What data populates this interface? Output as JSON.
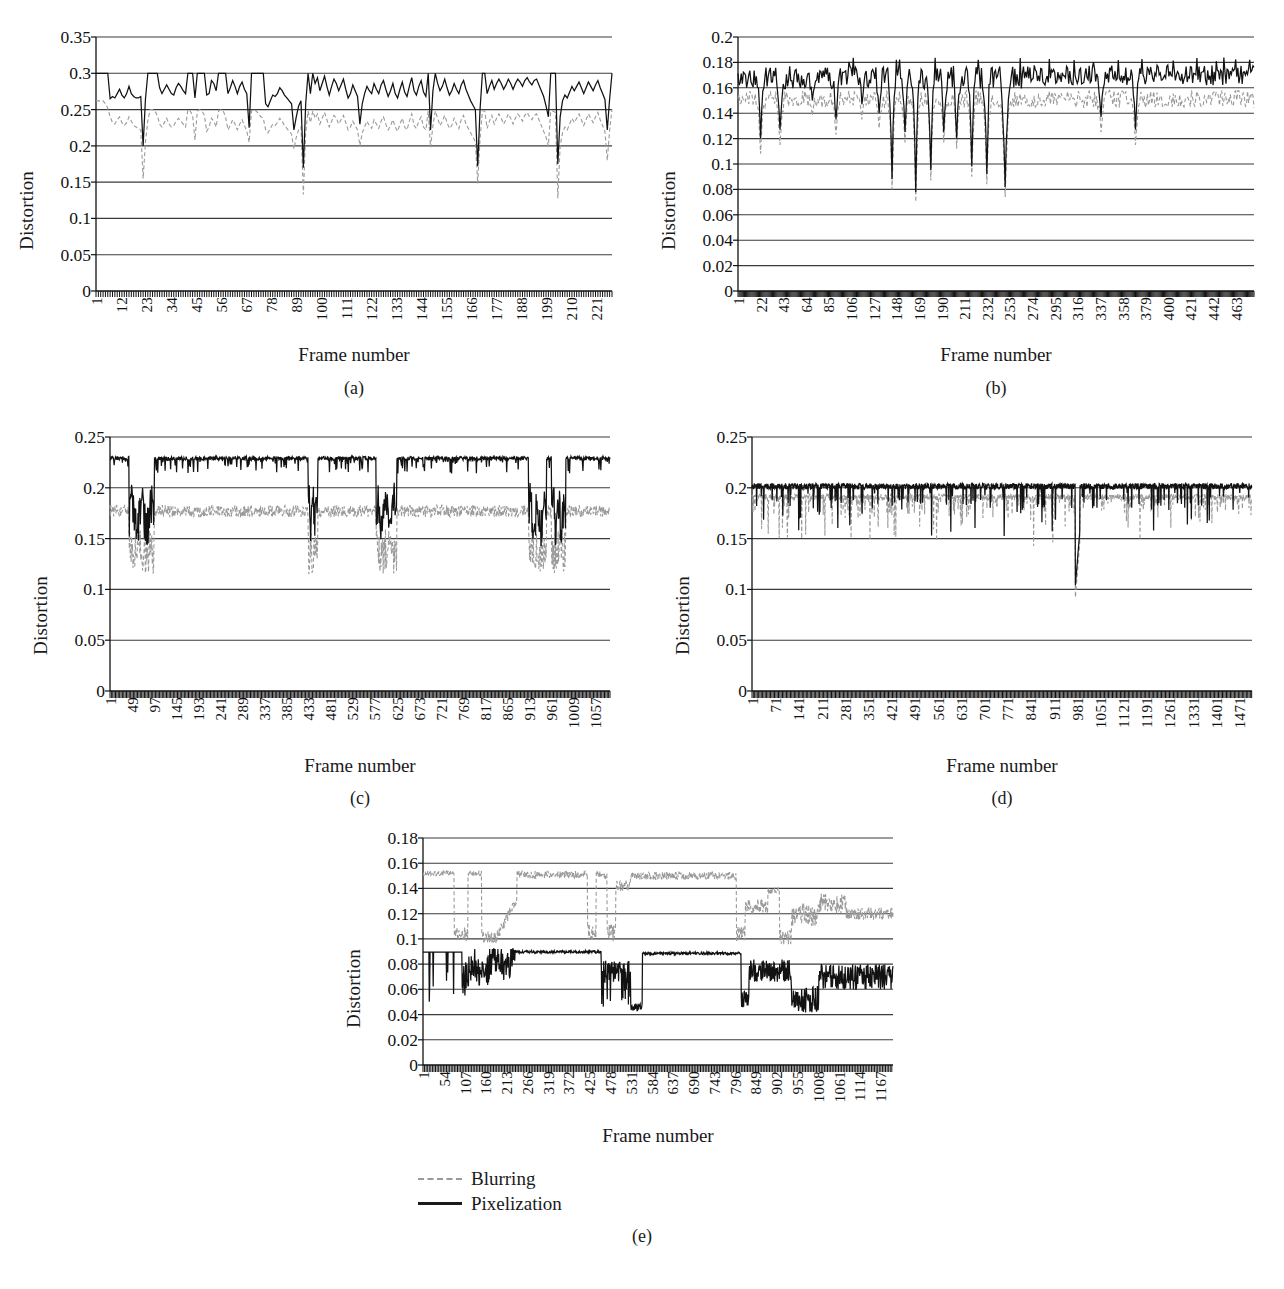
{
  "figure": {
    "legend": {
      "items": [
        {
          "label": "Blurring",
          "style": "dashed",
          "color": "#9a9a9a"
        },
        {
          "label": "Pixelization",
          "style": "solid",
          "color": "#1a1a1a"
        }
      ]
    },
    "caption": "",
    "axis_title_x": "Frame number",
    "axis_title_y": "Distortion"
  },
  "chart_data": [
    {
      "id": "a",
      "type": "line",
      "subcaption": "(a)",
      "title": "",
      "xlabel": "Frame number",
      "ylabel": "Distortion",
      "ylim": [
        0,
        0.35
      ],
      "yticks": [
        "0",
        "0.05",
        "0.1",
        "0.15",
        "0.2",
        "0.25",
        "0.3",
        "0.35"
      ],
      "ytick_values": [
        0,
        0.05,
        0.1,
        0.15,
        0.2,
        0.25,
        0.3,
        0.35
      ],
      "xticks": [
        "1",
        "12",
        "23",
        "34",
        "45",
        "56",
        "67",
        "78",
        "89",
        "100",
        "111",
        "122",
        "133",
        "144",
        "155",
        "166",
        "177",
        "188",
        "199",
        "210",
        "221"
      ],
      "xtick_values": [
        1,
        12,
        23,
        34,
        45,
        56,
        67,
        78,
        89,
        100,
        111,
        122,
        133,
        144,
        155,
        166,
        177,
        188,
        199,
        210,
        221
      ],
      "xlim": [
        1,
        228
      ],
      "grid": true,
      "legend_position": "none",
      "series": [
        {
          "name": "Pixelization",
          "values": [
            0.3,
            0.3,
            0.3,
            0.3,
            0.3,
            0.3,
            0.265,
            0.268,
            0.266,
            0.272,
            0.278,
            0.27,
            0.266,
            0.272,
            0.282,
            0.272,
            0.268,
            0.266,
            0.266,
            0.268,
            0.2,
            0.265,
            0.3,
            0.3,
            0.3,
            0.3,
            0.3,
            0.28,
            0.272,
            0.278,
            0.284,
            0.278,
            0.272,
            0.27,
            0.28,
            0.286,
            0.282,
            0.276,
            0.272,
            0.3,
            0.3,
            0.3,
            0.266,
            0.3,
            0.3,
            0.3,
            0.3,
            0.27,
            0.272,
            0.29,
            0.286,
            0.276,
            0.3,
            0.3,
            0.3,
            0.3,
            0.272,
            0.28,
            0.29,
            0.282,
            0.272,
            0.282,
            0.288,
            0.278,
            0.272,
            0.225,
            0.3,
            0.3,
            0.3,
            0.3,
            0.3,
            0.3,
            0.258,
            0.254,
            0.262,
            0.27,
            0.268,
            0.272,
            0.28,
            0.276,
            0.27,
            0.266,
            0.262,
            0.258,
            0.222,
            0.24,
            0.255,
            0.262,
            0.17,
            0.258,
            0.3,
            0.272,
            0.3,
            0.286,
            0.294,
            0.276,
            0.286,
            0.296,
            0.282,
            0.27,
            0.282,
            0.292,
            0.286,
            0.276,
            0.284,
            0.292,
            0.278,
            0.266,
            0.272,
            0.284,
            0.276,
            0.268,
            0.23,
            0.258,
            0.272,
            0.282,
            0.276,
            0.272,
            0.286,
            0.278,
            0.272,
            0.284,
            0.29,
            0.278,
            0.268,
            0.276,
            0.286,
            0.272,
            0.266,
            0.278,
            0.288,
            0.274,
            0.268,
            0.282,
            0.294,
            0.276,
            0.27,
            0.282,
            0.29,
            0.274,
            0.268,
            0.3,
            0.222,
            0.276,
            0.3,
            0.286,
            0.276,
            0.282,
            0.292,
            0.28,
            0.27,
            0.276,
            0.286,
            0.278,
            0.272,
            0.284,
            0.29,
            0.278,
            0.27,
            0.262,
            0.256,
            0.25,
            0.172,
            0.25,
            0.3,
            0.3,
            0.272,
            0.282,
            0.29,
            0.278,
            0.286,
            0.292,
            0.286,
            0.278,
            0.284,
            0.292,
            0.286,
            0.278,
            0.286,
            0.292,
            0.288,
            0.282,
            0.29,
            0.294,
            0.288,
            0.284,
            0.29,
            0.292,
            0.284,
            0.276,
            0.268,
            0.255,
            0.24,
            0.3,
            0.3,
            0.3,
            0.175,
            0.24,
            0.262,
            0.27,
            0.266,
            0.274,
            0.282,
            0.276,
            0.282,
            0.288,
            0.28,
            0.272,
            0.28,
            0.288,
            0.282,
            0.276,
            0.284,
            0.29,
            0.28,
            0.272,
            0.264,
            0.222,
            0.265,
            0.3
          ]
        },
        {
          "name": "Blurring",
          "values": [
            0.262,
            0.262,
            0.262,
            0.262,
            0.258,
            0.252,
            0.24,
            0.232,
            0.23,
            0.236,
            0.24,
            0.232,
            0.228,
            0.232,
            0.24,
            0.234,
            0.228,
            0.226,
            0.224,
            0.222,
            0.155,
            0.205,
            0.235,
            0.25,
            0.25,
            0.248,
            0.242,
            0.23,
            0.226,
            0.232,
            0.238,
            0.23,
            0.226,
            0.228,
            0.234,
            0.238,
            0.234,
            0.23,
            0.226,
            0.25,
            0.248,
            0.242,
            0.208,
            0.248,
            0.25,
            0.248,
            0.242,
            0.22,
            0.226,
            0.238,
            0.234,
            0.226,
            0.248,
            0.25,
            0.248,
            0.24,
            0.222,
            0.228,
            0.236,
            0.23,
            0.222,
            0.23,
            0.236,
            0.228,
            0.22,
            0.205,
            0.248,
            0.25,
            0.248,
            0.244,
            0.24,
            0.238,
            0.222,
            0.218,
            0.224,
            0.23,
            0.228,
            0.232,
            0.238,
            0.234,
            0.228,
            0.224,
            0.22,
            0.216,
            0.196,
            0.212,
            0.222,
            0.226,
            0.133,
            0.218,
            0.248,
            0.232,
            0.248,
            0.238,
            0.244,
            0.23,
            0.238,
            0.246,
            0.236,
            0.226,
            0.234,
            0.242,
            0.238,
            0.23,
            0.236,
            0.242,
            0.232,
            0.222,
            0.226,
            0.234,
            0.228,
            0.222,
            0.2,
            0.218,
            0.226,
            0.234,
            0.228,
            0.224,
            0.236,
            0.23,
            0.224,
            0.234,
            0.24,
            0.23,
            0.222,
            0.228,
            0.236,
            0.226,
            0.22,
            0.23,
            0.238,
            0.226,
            0.222,
            0.234,
            0.244,
            0.228,
            0.224,
            0.234,
            0.24,
            0.226,
            0.222,
            0.248,
            0.198,
            0.228,
            0.248,
            0.238,
            0.228,
            0.234,
            0.242,
            0.232,
            0.224,
            0.228,
            0.238,
            0.23,
            0.224,
            0.236,
            0.242,
            0.23,
            0.224,
            0.218,
            0.212,
            0.206,
            0.148,
            0.21,
            0.248,
            0.248,
            0.224,
            0.234,
            0.242,
            0.23,
            0.238,
            0.244,
            0.238,
            0.23,
            0.236,
            0.244,
            0.238,
            0.23,
            0.238,
            0.244,
            0.24,
            0.234,
            0.242,
            0.246,
            0.24,
            0.236,
            0.242,
            0.244,
            0.236,
            0.228,
            0.22,
            0.212,
            0.2,
            0.248,
            0.248,
            0.246,
            0.128,
            0.2,
            0.218,
            0.226,
            0.222,
            0.23,
            0.238,
            0.232,
            0.238,
            0.244,
            0.236,
            0.228,
            0.236,
            0.244,
            0.238,
            0.232,
            0.24,
            0.246,
            0.236,
            0.228,
            0.22,
            0.18,
            0.222,
            0.25
          ]
        }
      ]
    },
    {
      "id": "b",
      "type": "line",
      "subcaption": "(b)",
      "title": "",
      "xlabel": "Frame number",
      "ylabel": "Distortion",
      "ylim": [
        0,
        0.2
      ],
      "yticks": [
        "0",
        "0.02",
        "0.04",
        "0.06",
        "0.08",
        "0.1",
        "0.12",
        "0.14",
        "0.16",
        "0.18",
        "0.2"
      ],
      "ytick_values": [
        0,
        0.02,
        0.04,
        0.06,
        0.08,
        0.1,
        0.12,
        0.14,
        0.16,
        0.18,
        0.2
      ],
      "xticks": [
        "1",
        "22",
        "43",
        "64",
        "85",
        "106",
        "127",
        "148",
        "169",
        "190",
        "211",
        "232",
        "253",
        "274",
        "295",
        "316",
        "337",
        "358",
        "379",
        "400",
        "421",
        "442",
        "463"
      ],
      "xtick_values": [
        1,
        22,
        43,
        64,
        85,
        106,
        127,
        148,
        169,
        190,
        211,
        232,
        253,
        274,
        295,
        316,
        337,
        358,
        379,
        400,
        421,
        442,
        463
      ],
      "xlim": [
        1,
        480
      ],
      "grid": true,
      "legend_position": "none",
      "series_note": "Pixelization oscillates 0.16-0.18 with deep drops to 0.08-0.13 concentrated between frames 140-255; Blurring tracks 0.145-0.16 with matching drops."
    },
    {
      "id": "c",
      "type": "line",
      "subcaption": "(c)",
      "title": "",
      "xlabel": "Frame number",
      "ylabel": "Distortion",
      "ylim": [
        0,
        0.25
      ],
      "yticks": [
        "0",
        "0.05",
        "0.1",
        "0.15",
        "0.2",
        "0.25"
      ],
      "ytick_values": [
        0,
        0.05,
        0.1,
        0.15,
        0.2,
        0.25
      ],
      "xticks": [
        "1",
        "49",
        "97",
        "145",
        "193",
        "241",
        "289",
        "337",
        "385",
        "433",
        "481",
        "529",
        "577",
        "625",
        "673",
        "721",
        "769",
        "817",
        "865",
        "913",
        "961",
        "1009",
        "1057"
      ],
      "xtick_values": [
        1,
        49,
        97,
        145,
        193,
        241,
        289,
        337,
        385,
        433,
        481,
        529,
        577,
        625,
        673,
        721,
        769,
        817,
        865,
        913,
        961,
        1009,
        1057
      ],
      "xlim": [
        1,
        1090
      ],
      "grid": true,
      "legend_position": "none",
      "series_note": "Pixelization plateaus near 0.23 with shot-drops to 0.15-0.17 around frames 50-95, 440, 590-620, 920-990; Blurring sits near 0.175 with matching drops to 0.11-0.13."
    },
    {
      "id": "d",
      "type": "line",
      "subcaption": "(d)",
      "title": "",
      "xlabel": "Frame number",
      "ylabel": "Distortion",
      "ylim": [
        0,
        0.25
      ],
      "yticks": [
        "0",
        "0.05",
        "0.1",
        "0.15",
        "0.2",
        "0.25"
      ],
      "ytick_values": [
        0,
        0.05,
        0.1,
        0.15,
        0.2,
        0.25
      ],
      "xticks": [
        "1",
        "71",
        "141",
        "211",
        "281",
        "351",
        "421",
        "491",
        "561",
        "631",
        "701",
        "771",
        "841",
        "911",
        "981",
        "1051",
        "1121",
        "1191",
        "1261",
        "1331",
        "1401",
        "1471"
      ],
      "xtick_values": [
        1,
        71,
        141,
        211,
        281,
        351,
        421,
        491,
        561,
        631,
        701,
        771,
        841,
        911,
        981,
        1051,
        1121,
        1191,
        1261,
        1331,
        1401,
        1471
      ],
      "xlim": [
        1,
        1510
      ],
      "grid": true,
      "legend_position": "none",
      "series_note": "Pixelization hugs 0.20 throughout with frequent narrow drops to 0.15-0.18 and one deep spike to 0.10 near frame 985; Blurring near 0.19 with similar drops."
    },
    {
      "id": "e",
      "type": "line",
      "subcaption": "(e)",
      "title": "",
      "xlabel": "Frame number",
      "ylabel": "Distortion",
      "ylim": [
        0,
        0.18
      ],
      "yticks": [
        "0",
        "0.02",
        "0.04",
        "0.06",
        "0.08",
        "0.1",
        "0.12",
        "0.14",
        "0.16",
        "0.18"
      ],
      "ytick_values": [
        0,
        0.02,
        0.04,
        0.06,
        0.08,
        0.1,
        0.12,
        0.14,
        0.16,
        0.18
      ],
      "xticks": [
        "1",
        "54",
        "107",
        "160",
        "213",
        "266",
        "319",
        "372",
        "425",
        "478",
        "531",
        "584",
        "637",
        "690",
        "743",
        "796",
        "849",
        "902",
        "955",
        "1008",
        "1061",
        "1114",
        "1167"
      ],
      "xtick_values": [
        1,
        54,
        107,
        160,
        213,
        266,
        319,
        372,
        425,
        478,
        531,
        584,
        637,
        690,
        743,
        796,
        849,
        902,
        955,
        1008,
        1061,
        1114,
        1167
      ],
      "xlim": [
        1,
        1200
      ],
      "grid": true,
      "legend_position": "below",
      "series_note": "Pixelization steps between plateaus at 0.09 and noisy bands 0.04-0.08; Blurring rides 0.10-0.155 with plateaus at 0.153 and drops toward 0.09-0.12."
    }
  ]
}
